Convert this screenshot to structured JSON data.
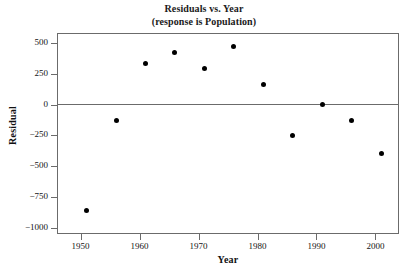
{
  "chart_data": {
    "type": "scatter",
    "title": "Residuals vs. Year",
    "subtitle": "(response is Population)",
    "xlabel": "Year",
    "ylabel": "Residual",
    "xlim": [
      1946,
      2004
    ],
    "ylim": [
      -1050,
      580
    ],
    "xticks": [
      1950,
      1960,
      1970,
      1980,
      1990,
      2000
    ],
    "xtick_labels": [
      "1950",
      "1960",
      "1970",
      "1980",
      "1990",
      "2000"
    ],
    "yticks": [
      500,
      250,
      0,
      -250,
      -500,
      -750,
      -1000
    ],
    "ytick_labels": [
      "500",
      "250",
      "0",
      "-250",
      "-500",
      "-750",
      "-1000"
    ],
    "grid": false,
    "legend": null,
    "reference_line": {
      "orientation": "horizontal",
      "value": 0
    },
    "x": [
      1951,
      1956,
      1961,
      1966,
      1971,
      1976,
      1981,
      1986,
      1991,
      1996,
      2001
    ],
    "y": [
      -860,
      -130,
      335,
      420,
      290,
      470,
      165,
      -248,
      -3,
      -128,
      -400
    ],
    "points": [
      {
        "x": 1951,
        "y": -860
      },
      {
        "x": 1956,
        "y": -130
      },
      {
        "x": 1961,
        "y": 335
      },
      {
        "x": 1966,
        "y": 420
      },
      {
        "x": 1971,
        "y": 290
      },
      {
        "x": 1976,
        "y": 470
      },
      {
        "x": 1981,
        "y": 165
      },
      {
        "x": 1986,
        "y": -248
      },
      {
        "x": 1991,
        "y": -3
      },
      {
        "x": 1996,
        "y": -128
      },
      {
        "x": 2001,
        "y": -400
      }
    ],
    "marker": {
      "shape": "circle",
      "color": "#000000",
      "size": 5
    }
  }
}
